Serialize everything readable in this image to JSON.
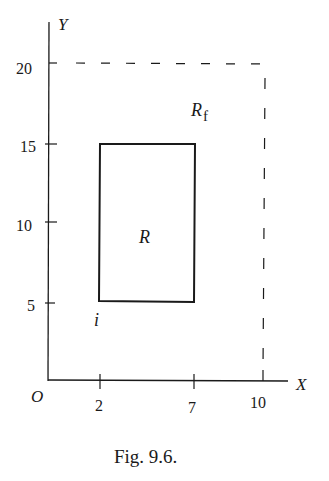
{
  "figure": {
    "caption": "Fig. 9.6.",
    "axes": {
      "x_label": "X",
      "y_label": "Y",
      "origin_label": "O",
      "x_ticks": [
        "2",
        "7",
        "10"
      ],
      "y_ticks": [
        "5",
        "10",
        "15",
        "20"
      ]
    },
    "regions": {
      "inner": {
        "label": "R",
        "x_range": [
          2,
          7
        ],
        "y_range": [
          5,
          15
        ],
        "style": "solid"
      },
      "outer": {
        "label": "R",
        "subscript": "f",
        "x_range": [
          0,
          10
        ],
        "y_range": [
          0,
          20
        ],
        "style": "dashed"
      }
    },
    "point_label": "i",
    "colors": {
      "ink": "#1a1a1a",
      "background": "#ffffff"
    }
  }
}
